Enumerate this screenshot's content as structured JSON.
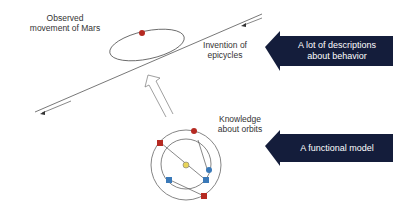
{
  "diagram": {
    "labels": {
      "observed": [
        "Observed",
        "movement of Mars"
      ],
      "epicycles": [
        "Invention of",
        "epicycles"
      ],
      "knowledge": [
        "Knowledge",
        "about orbits"
      ]
    },
    "boxes": [
      {
        "id": "descriptions",
        "text_lines": [
          "A lot of descriptions",
          "about behavior"
        ]
      },
      {
        "id": "model",
        "text_lines": [
          "A functional model"
        ]
      }
    ],
    "colors": {
      "box_fill": "#141d3b",
      "line": "#444444",
      "mars_red": "#b52a22",
      "planet_blue": "#3a79b8",
      "sun_yellow": "#e8d45a"
    }
  }
}
